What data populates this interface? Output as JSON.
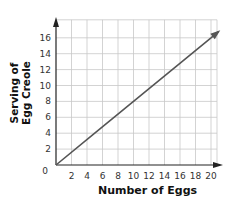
{
  "chart_data": {
    "type": "line",
    "title": "",
    "xlabel": "Number of Eggs",
    "ylabel": "Serving of Egg Creole",
    "ylabel_lines": [
      "Serving of",
      "Egg Creole"
    ],
    "x_ticks": [
      2,
      4,
      6,
      8,
      10,
      12,
      14,
      16,
      18,
      20
    ],
    "y_ticks": [
      2,
      4,
      6,
      8,
      10,
      12,
      14,
      16
    ],
    "origin_label": "0",
    "xlim": [
      0,
      21
    ],
    "ylim": [
      0,
      17.5
    ],
    "grid": true,
    "series": [
      {
        "name": "servings",
        "x": [
          0,
          5,
          10,
          15,
          20
        ],
        "y": [
          0,
          4,
          8,
          12,
          16
        ],
        "arrow_end": true,
        "color": "#555555"
      }
    ]
  }
}
